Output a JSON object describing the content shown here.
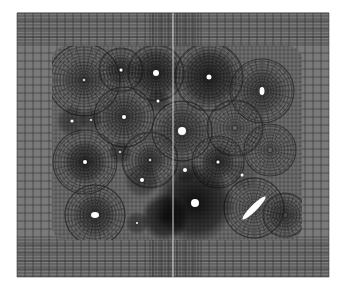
{
  "figure": {
    "kind": "finite-element-mesh",
    "canvas": {
      "width": 346,
      "height": 285,
      "background": "#ffffff"
    },
    "outer_domain": {
      "x": 17,
      "y": 13,
      "width": 312,
      "height": 264,
      "fill": "#7a7a7a",
      "line": "#2a2a2a",
      "grid_spacing_x": 8,
      "grid_spacing_y": 8
    },
    "seam": {
      "x": 173,
      "color": "#d8d8d8"
    },
    "inner_region": {
      "x": 52,
      "y": 46,
      "width": 250,
      "height": 194,
      "fill": "#6e6e6e"
    },
    "holes": [
      {
        "cx": 121,
        "cy": 70,
        "r": 1.5,
        "ring": 16,
        "dark": 0.35
      },
      {
        "cx": 156,
        "cy": 73,
        "r": 3,
        "ring": 26,
        "dark": 0.55
      },
      {
        "cx": 84,
        "cy": 80,
        "r": 1,
        "ring": 22,
        "dark": 0.25
      },
      {
        "cx": 209,
        "cy": 77,
        "r": 2.5,
        "ring": 30,
        "dark": 0.6
      },
      {
        "cx": 262,
        "cy": 91,
        "rx": 2.5,
        "ry": 4,
        "ring": 24,
        "dark": 0.3
      },
      {
        "cx": 158,
        "cy": 101,
        "r": 1.5,
        "ring": 12,
        "dark": 0.45
      },
      {
        "cx": 72,
        "cy": 121,
        "r": 1.5,
        "ring": 16,
        "dark": 0.45
      },
      {
        "cx": 91,
        "cy": 120,
        "r": 1,
        "ring": 12,
        "dark": 0.4
      },
      {
        "cx": 124,
        "cy": 117,
        "r": 2,
        "ring": 24,
        "dark": 0.3
      },
      {
        "cx": 182,
        "cy": 131,
        "r": 4,
        "ring": 26,
        "dark": 0.3
      },
      {
        "cx": 120,
        "cy": 152,
        "r": 1,
        "ring": 12,
        "dark": 0.45
      },
      {
        "cx": 85,
        "cy": 162,
        "r": 2,
        "ring": 22,
        "dark": 0.5
      },
      {
        "cx": 150,
        "cy": 160,
        "r": 1,
        "ring": 16,
        "dark": 0.3
      },
      {
        "cx": 218,
        "cy": 162,
        "r": 1.5,
        "ring": 18,
        "dark": 0.45
      },
      {
        "cx": 185,
        "cy": 170,
        "r": 2,
        "ring": 14,
        "dark": 0.35
      },
      {
        "cx": 142,
        "cy": 180,
        "r": 2,
        "ring": 18,
        "dark": 0.4
      },
      {
        "cx": 242,
        "cy": 175,
        "r": 1.5,
        "ring": 16,
        "dark": 0.2
      },
      {
        "cx": 195,
        "cy": 203,
        "r": 4,
        "ring": 40,
        "dark": 0.85
      },
      {
        "cx": 165,
        "cy": 217,
        "r": 0,
        "ring": 24,
        "dark": 0.8
      },
      {
        "cx": 95,
        "cy": 215,
        "rx": 4,
        "ry": 3,
        "ring": 22,
        "dark": 0.4
      },
      {
        "cx": 137,
        "cy": 223,
        "r": 1,
        "ring": 12,
        "dark": 0.45
      },
      {
        "cx": 285,
        "cy": 215,
        "r": 0,
        "ring": 18,
        "dark": 0.25
      }
    ],
    "ellipse_hole": {
      "cx": 254,
      "cy": 208,
      "rx": 16,
      "ry": 3.2,
      "rotate": -45,
      "fill": "#ffffff"
    },
    "radial_rings": [
      {
        "cx": 84,
        "cy": 80,
        "r": 36
      },
      {
        "cx": 124,
        "cy": 117,
        "r": 30
      },
      {
        "cx": 209,
        "cy": 77,
        "r": 34
      },
      {
        "cx": 262,
        "cy": 91,
        "r": 32
      },
      {
        "cx": 182,
        "cy": 131,
        "r": 30
      },
      {
        "cx": 235,
        "cy": 128,
        "r": 28
      },
      {
        "cx": 85,
        "cy": 162,
        "r": 32
      },
      {
        "cx": 150,
        "cy": 160,
        "r": 28
      },
      {
        "cx": 218,
        "cy": 162,
        "r": 26
      },
      {
        "cx": 270,
        "cy": 150,
        "r": 26
      },
      {
        "cx": 95,
        "cy": 215,
        "r": 30
      },
      {
        "cx": 254,
        "cy": 208,
        "r": 30
      },
      {
        "cx": 285,
        "cy": 215,
        "r": 22
      },
      {
        "cx": 121,
        "cy": 70,
        "r": 22
      },
      {
        "cx": 156,
        "cy": 73,
        "r": 28
      }
    ]
  }
}
